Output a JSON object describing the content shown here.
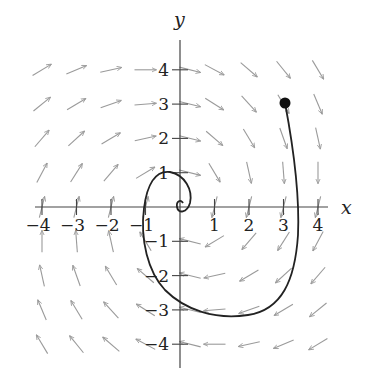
{
  "figure": {
    "type": "direction-field-with-solution-curve",
    "axes": {
      "x_label": "x",
      "y_label": "y",
      "x_range": [
        -4,
        4
      ],
      "y_range": [
        -4,
        4
      ],
      "x_ticks": [
        -4,
        -3,
        -2,
        -1,
        1,
        2,
        3,
        4
      ],
      "y_ticks": [
        -4,
        -3,
        -2,
        -1,
        1,
        2,
        3,
        4
      ],
      "x_tick_labels": [
        "−4",
        "−3",
        "−2",
        "−1",
        "1",
        "2",
        "3",
        "4"
      ],
      "y_tick_labels": [
        "−4",
        "−3",
        "−2",
        "−1",
        "1",
        "2",
        "3",
        "4"
      ]
    },
    "vector_field": {
      "grid_x": [
        -4,
        -3,
        -2,
        -1,
        0,
        1,
        2,
        3,
        4
      ],
      "grid_y": [
        -4,
        -3,
        -2,
        -1,
        0,
        1,
        2,
        3,
        4
      ],
      "behavior": "clockwise rotation with inward spiral toward origin",
      "arrow_color": "#9a9a9a"
    },
    "solution_curve": {
      "start_point": [
        3,
        3
      ],
      "start_marker": "filled-circle",
      "end_behavior": "spirals into origin",
      "color": "#222222"
    }
  }
}
